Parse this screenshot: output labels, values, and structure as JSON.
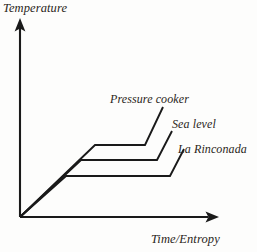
{
  "figure": {
    "kind": "thermodynamic-heating-curve-diagram",
    "background_color": "#fdfdfc",
    "line_color": "#1a1a1a",
    "text_color": "#2a2520"
  },
  "axes": {
    "y_label": "Temperature",
    "x_label": "Time/Entropy",
    "y_axis_icon": "up-arrow-axis-icon",
    "x_axis_icon": "right-arrow-axis-icon",
    "origin": {
      "x": 20,
      "y": 217
    },
    "y_tip": {
      "x": 20,
      "y": 20
    },
    "x_tip": {
      "x": 218,
      "y": 217
    },
    "ticks": [],
    "gridlines": false
  },
  "curves": [
    {
      "name": "pressure-cooker",
      "label": "Pressure cooker",
      "plateau_rank": 1,
      "plateau_description": "highest boiling plateau",
      "points": [
        {
          "x": 20,
          "y": 217
        },
        {
          "x": 95,
          "y": 145
        },
        {
          "x": 145,
          "y": 145
        },
        {
          "x": 163,
          "y": 107
        }
      ]
    },
    {
      "name": "sea-level",
      "label": "Sea level",
      "plateau_rank": 2,
      "plateau_description": "middle boiling plateau",
      "points": [
        {
          "x": 20,
          "y": 217
        },
        {
          "x": 81,
          "y": 160
        },
        {
          "x": 157,
          "y": 160
        },
        {
          "x": 172,
          "y": 131
        }
      ]
    },
    {
      "name": "la-rinconada",
      "label": "La Rinconada",
      "plateau_rank": 3,
      "plateau_description": "lowest boiling plateau",
      "points": [
        {
          "x": 20,
          "y": 217
        },
        {
          "x": 66,
          "y": 176
        },
        {
          "x": 170,
          "y": 176
        },
        {
          "x": 184,
          "y": 149
        }
      ]
    }
  ],
  "chart_data": {
    "type": "line",
    "title": "",
    "subtitle": "",
    "xlabel": "Time/Entropy",
    "ylabel": "Temperature",
    "grid": false,
    "legend_position": "inline-end-labels",
    "annotations": [
      "Pressure cooker",
      "Sea level",
      "La Rinconada"
    ],
    "xlim": [
      0,
      1
    ],
    "ylim": [
      0,
      1
    ],
    "series": [
      {
        "name": "Pressure cooker",
        "x": [
          0.0,
          0.38,
          0.63,
          0.72
        ],
        "y": [
          0.0,
          0.37,
          0.37,
          0.56
        ]
      },
      {
        "name": "Sea level",
        "x": [
          0.0,
          0.31,
          0.69,
          0.77
        ],
        "y": [
          0.0,
          0.29,
          0.29,
          0.44
        ]
      },
      {
        "name": "La Rinconada",
        "x": [
          0.0,
          0.23,
          0.76,
          0.83
        ],
        "y": [
          0.0,
          0.21,
          0.21,
          0.35
        ]
      }
    ]
  }
}
